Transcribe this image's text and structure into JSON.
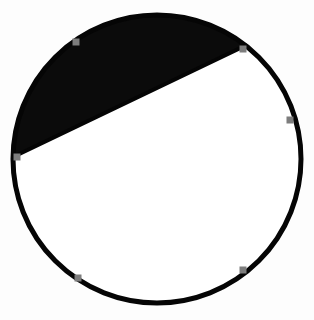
{
  "figure": {
    "title": "Circle with shaded minor segment",
    "background_color": "#fdfdfd",
    "width": 314,
    "height": 320
  },
  "chart_data": {
    "type": "diagram",
    "shape": "circle-segment",
    "title": "Circle with shaded minor segment",
    "xlabel": "",
    "ylabel": "",
    "xlim": [
      0,
      314
    ],
    "ylim": [
      0,
      320
    ],
    "grid": false,
    "legend": "none",
    "circle": {
      "center_x": 157,
      "center_y": 159,
      "radius": 144,
      "stroke_color": "#050505",
      "stroke_width": 5,
      "fill_color": "#ffffff"
    },
    "chord": {
      "x1": 17,
      "y1": 157,
      "x2": 243,
      "y2": 49,
      "stroke_color": "#050505",
      "stroke_width": 4,
      "length": 250.5,
      "angle_degrees": -25.5
    },
    "shaded_segment": {
      "name": "minor-segment-above-chord",
      "fill_color": "#0b0b0b",
      "position": "above chord",
      "arc_span_degrees": 154,
      "fraction_of_circle": 0.32
    },
    "markers": [
      {
        "id": "marker-1",
        "x": 76,
        "y": 42,
        "label": "upper-left",
        "color": "#7d7d7d",
        "size": 7
      },
      {
        "id": "marker-2",
        "x": 243,
        "y": 49,
        "label": "upper-right",
        "color": "#7d7d7d",
        "size": 7
      },
      {
        "id": "marker-3",
        "x": 290,
        "y": 120,
        "label": "right",
        "color": "#7d7d7d",
        "size": 7
      },
      {
        "id": "marker-4",
        "x": 243,
        "y": 270,
        "label": "lower-right",
        "color": "#7d7d7d",
        "size": 7
      },
      {
        "id": "marker-5",
        "x": 78,
        "y": 278,
        "label": "lower-left",
        "color": "#7d7d7d",
        "size": 7
      },
      {
        "id": "marker-6",
        "x": 17,
        "y": 157,
        "label": "left",
        "color": "#7d7d7d",
        "size": 7
      }
    ],
    "marker_color": "#7d7d7d",
    "marker_count": 6
  }
}
